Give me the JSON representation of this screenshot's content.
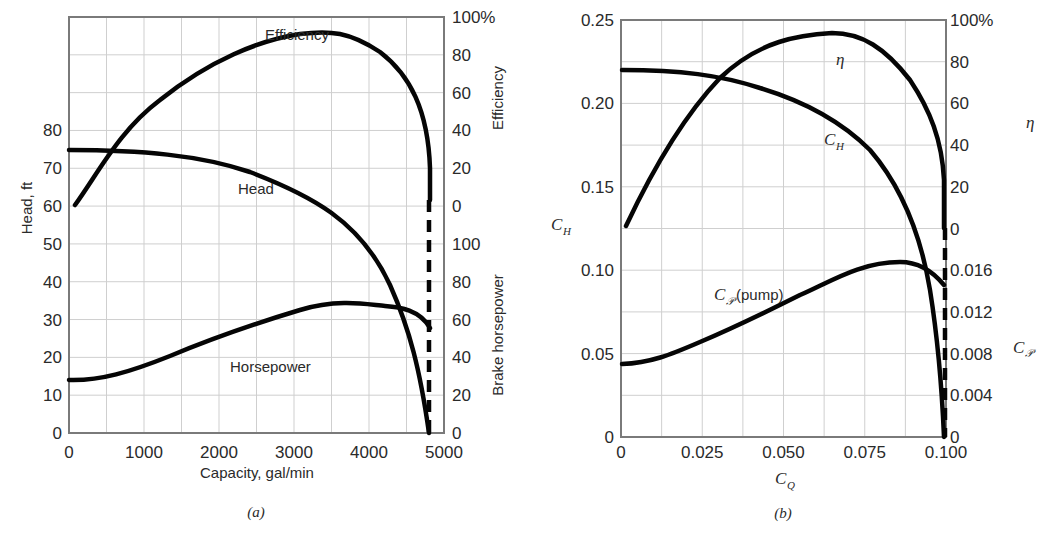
{
  "chart_data": [
    {
      "panel": "(a)",
      "type": "line",
      "title": "",
      "xlabel": "Capacity, gal/min",
      "ylabel": "Head, ft",
      "right_labels": [
        "Efficiency",
        "Brake horsepower"
      ],
      "xlim": [
        0,
        5000
      ],
      "ylim": [
        0,
        110
      ],
      "grid": true,
      "x_ticks": [
        "0",
        "1000",
        "2000",
        "3000",
        "4000",
        "5000"
      ],
      "y_ticks_left": [
        "0",
        "10",
        "20",
        "30",
        "40",
        "50",
        "60",
        "70",
        "80"
      ],
      "y_ticks_right_efficiency": [
        "0",
        "20",
        "40",
        "60",
        "80",
        "100%"
      ],
      "y_ticks_right_bhp": [
        "0",
        "20",
        "40",
        "60",
        "80",
        "100"
      ],
      "series": [
        {
          "name": "Efficiency",
          "axis": "efficiency (%)",
          "x": [
            50,
            500,
            1000,
            1500,
            2000,
            2500,
            3000,
            3500,
            4000,
            4300,
            4500,
            4650,
            4750
          ],
          "values": [
            0,
            30,
            52,
            68,
            80,
            87,
            90,
            89,
            82,
            72,
            58,
            42,
            20
          ]
        },
        {
          "name": "Head",
          "axis": "head (ft)",
          "x": [
            0,
            500,
            1000,
            1500,
            2000,
            2500,
            3000,
            3500,
            4000,
            4300,
            4500,
            4650,
            4750
          ],
          "values": [
            75,
            75,
            74.5,
            73.5,
            72,
            69.5,
            66,
            60,
            50,
            40,
            30,
            18,
            0
          ]
        },
        {
          "name": "Horsepower",
          "axis": "brake horsepower",
          "x": [
            0,
            250,
            500,
            1000,
            1500,
            2000,
            2500,
            3000,
            3500,
            4000,
            4200,
            4500,
            4750
          ],
          "values": [
            26,
            26,
            27,
            30,
            35,
            41,
            47,
            53,
            60,
            65,
            66,
            63,
            53
          ]
        }
      ],
      "annotations": [
        "Efficiency",
        "Head",
        "Horsepower",
        "dashed vertical line at ~4750 gal/min"
      ],
      "caption": "(a)"
    },
    {
      "panel": "(b)",
      "type": "line",
      "title": "",
      "xlabel": "C_Q",
      "ylabel": "C_H",
      "right_labels": [
        "η",
        "C_P"
      ],
      "xlim": [
        0,
        0.1
      ],
      "ylim": [
        0,
        0.25
      ],
      "grid": true,
      "x_ticks": [
        "0",
        "0.025",
        "0.050",
        "0.075",
        "0.100"
      ],
      "y_ticks_left": [
        "0",
        "0.05",
        "0.10",
        "0.15",
        "0.20",
        "0.25"
      ],
      "y_ticks_right_eta": [
        "0",
        "20",
        "40",
        "60",
        "80",
        "100%"
      ],
      "y_ticks_right_cp": [
        "0",
        "0.004",
        "0.008",
        "0.012",
        "0.016"
      ],
      "series": [
        {
          "name": "η",
          "axis": "efficiency (%)",
          "x": [
            0.001,
            0.01,
            0.02,
            0.03,
            0.04,
            0.05,
            0.06,
            0.07,
            0.08,
            0.09,
            0.095,
            0.1
          ],
          "values": [
            0,
            30,
            52,
            68,
            80,
            87,
            90,
            89,
            82,
            60,
            42,
            20
          ]
        },
        {
          "name": "C_H",
          "axis": "C_H",
          "x": [
            0,
            0.01,
            0.02,
            0.03,
            0.04,
            0.05,
            0.06,
            0.07,
            0.08,
            0.09,
            0.095,
            0.1
          ],
          "values": [
            0.22,
            0.22,
            0.218,
            0.214,
            0.207,
            0.197,
            0.183,
            0.163,
            0.135,
            0.09,
            0.055,
            0
          ]
        },
        {
          "name": "C_P (pump)",
          "axis": "C_P",
          "x": [
            0,
            0.01,
            0.02,
            0.03,
            0.04,
            0.05,
            0.06,
            0.07,
            0.08,
            0.087,
            0.095,
            0.1
          ],
          "values": [
            0.0072,
            0.0078,
            0.0088,
            0.0102,
            0.0118,
            0.0134,
            0.015,
            0.0162,
            0.0168,
            0.0169,
            0.0158,
            0.0142
          ]
        }
      ],
      "annotations": [
        "η",
        "C_H",
        "C_P (pump)",
        "dashed vertical line at C_Q = 0.100"
      ],
      "caption": "(b)"
    }
  ],
  "panel_a": {
    "xlabel": "Capacity, gal/min",
    "ylabel": "Head, ft",
    "right_top_label": "Efficiency",
    "right_bottom_label": "Brake horsepower",
    "curve_labels": {
      "efficiency": "Efficiency",
      "head": "Head",
      "horsepower": "Horsepower"
    },
    "caption": "(a)"
  },
  "panel_b": {
    "xlabel_main": "C",
    "xlabel_sub": "Q",
    "ylabel_main": "C",
    "ylabel_sub": "H",
    "right_top_label": "η",
    "right_bottom_main": "C",
    "right_bottom_sub": "𝒫",
    "curve_labels": {
      "eta": "η",
      "ch_main": "C",
      "ch_sub": "H",
      "cp_main": "C",
      "cp_sub": "𝒫",
      "cp_suffix": "(pump)"
    },
    "caption": "(b)"
  }
}
